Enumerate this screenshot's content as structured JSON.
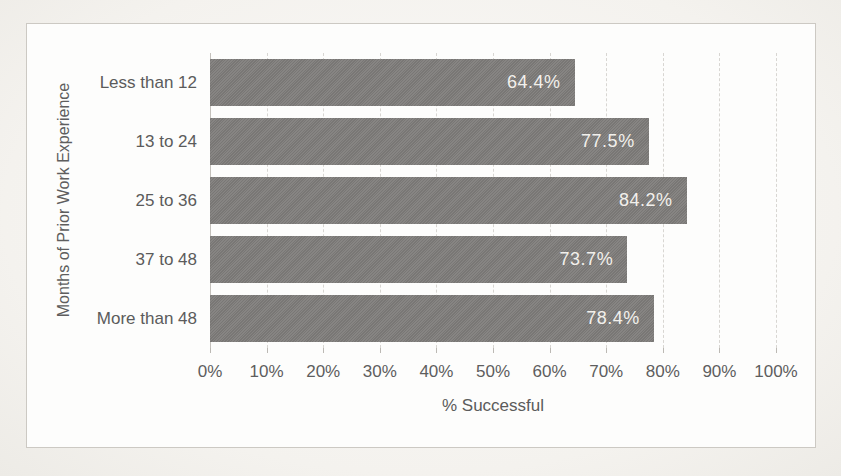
{
  "chart_data": {
    "type": "bar",
    "orientation": "horizontal",
    "title": "",
    "categories": [
      "Less than 12",
      "13 to 24",
      "25 to 36",
      "37 to 48",
      "More than 48"
    ],
    "values": [
      64.4,
      77.5,
      84.2,
      73.7,
      78.4
    ],
    "data_labels": [
      "64.4%",
      "77.5%",
      "84.2%",
      "73.7%",
      "78.4%"
    ],
    "xlabel": "% Successful",
    "ylabel": "Months of Prior Work Experience",
    "x_ticks": [
      "0%",
      "10%",
      "20%",
      "30%",
      "40%",
      "50%",
      "60%",
      "70%",
      "80%",
      "90%",
      "100%"
    ],
    "xlim": [
      0,
      100
    ],
    "grid": "vertical-dashed",
    "legend": "none",
    "data_labels_position": "inside-end",
    "colors": {
      "bar": "#7f7d7b",
      "data_label_text": "#f2f0ec",
      "axis_text": "#5b5b5b",
      "gridline": "#d8d6d2",
      "chart_border": "#ccc9c3",
      "chart_background": "#fdfdfc",
      "page_background": "#f5f3ef"
    }
  }
}
